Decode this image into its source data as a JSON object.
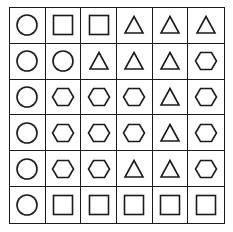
{
  "puzzle": {
    "rows": 6,
    "cols": 6,
    "line_color": "#1a1a1a",
    "grid": [
      [
        "circle",
        "square",
        "square",
        "triangle",
        "triangle",
        "triangle"
      ],
      [
        "circle",
        "circle",
        "triangle",
        "triangle",
        "triangle",
        "hexagon"
      ],
      [
        "circle",
        "hexagon",
        "hexagon",
        "hexagon",
        "triangle",
        "hexagon"
      ],
      [
        "circle",
        "hexagon",
        "hexagon",
        "hexagon",
        "triangle",
        "hexagon"
      ],
      [
        "circle",
        "hexagon",
        "hexagon",
        "triangle",
        "triangle",
        "hexagon"
      ],
      [
        "circle",
        "square",
        "square",
        "square",
        "square",
        "square"
      ]
    ]
  }
}
